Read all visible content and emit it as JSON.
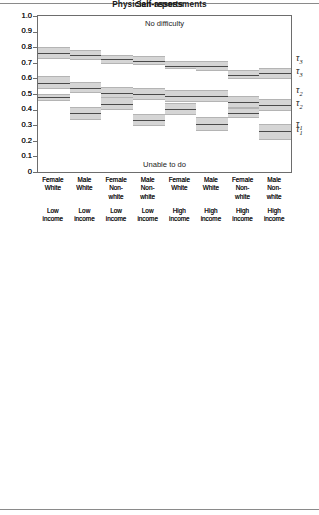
{
  "figure": {
    "categories": [
      {
        "sex": "Female",
        "race": "White",
        "race2": "",
        "income1": "Low",
        "income2": "income"
      },
      {
        "sex": "Male",
        "race": "White",
        "race2": "",
        "income1": "Low",
        "income2": "income"
      },
      {
        "sex": "Female",
        "race": "Non-",
        "race2": "white",
        "income1": "Low",
        "income2": "income"
      },
      {
        "sex": "Male",
        "race": "Non-",
        "race2": "white",
        "income1": "Low",
        "income2": "income"
      },
      {
        "sex": "Female",
        "race": "White",
        "race2": "",
        "income1": "High",
        "income2": "income"
      },
      {
        "sex": "Male",
        "race": "White",
        "race2": "",
        "income1": "High",
        "income2": "income"
      },
      {
        "sex": "Female",
        "race": "Non-",
        "race2": "white",
        "income1": "High",
        "income2": "income"
      },
      {
        "sex": "Male",
        "race": "Non-",
        "race2": "white",
        "income1": "High",
        "income2": "income"
      }
    ],
    "y_ticks": [
      "1.0",
      "0.9",
      "0.8",
      "0.7",
      "0.6",
      "0.5",
      "0.4",
      "0.3",
      "0.2",
      "0.1",
      "0"
    ],
    "threshold_labels": [
      {
        "glyph": "τ",
        "sub": "3"
      },
      {
        "glyph": "τ",
        "sub": "2"
      },
      {
        "glyph": "τ",
        "sub": "1"
      }
    ],
    "top_annotation": "No difficulty",
    "bottom_annotation": "Unable to do"
  },
  "chart_data": [
    {
      "type": "line",
      "title": "Physician-assessments",
      "xlabel": "",
      "ylabel": "",
      "ylim": [
        0,
        1
      ],
      "grid": false,
      "legend": "right-outside",
      "categories": [
        "Female White Low income",
        "Male White Low income",
        "Female Non-white Low income",
        "Male Non-white Low income",
        "Female White High income",
        "Male White High income",
        "Female Non-white High income",
        "Male Non-white High income"
      ],
      "annotations": [
        "No difficulty",
        "Unable to do"
      ],
      "series": [
        {
          "name": "τ3",
          "values": [
            0.925,
            0.885,
            0.875,
            0.835,
            0.805,
            0.775,
            0.755,
            0.715
          ],
          "ci_lower": [
            0.905,
            0.865,
            0.855,
            0.815,
            0.785,
            0.755,
            0.73,
            0.688
          ],
          "ci_upper": [
            0.945,
            0.905,
            0.89,
            0.855,
            0.822,
            0.795,
            0.775,
            0.74
          ]
        },
        {
          "name": "τ2",
          "values": [
            0.715,
            0.69,
            0.665,
            0.625,
            0.605,
            0.57,
            0.548,
            0.515
          ],
          "ci_lower": [
            0.685,
            0.665,
            0.638,
            0.598,
            0.578,
            0.54,
            0.518,
            0.478
          ],
          "ci_upper": [
            0.742,
            0.715,
            0.69,
            0.65,
            0.63,
            0.598,
            0.578,
            0.548
          ]
        },
        {
          "name": "τ1",
          "values": [
            0.442,
            0.458,
            0.368,
            0.382,
            0.348,
            0.378,
            0.278,
            0.292
          ],
          "ci_lower": [
            0.405,
            0.412,
            0.328,
            0.335,
            0.308,
            0.338,
            0.238,
            0.25
          ],
          "ci_upper": [
            0.478,
            0.5,
            0.405,
            0.425,
            0.388,
            0.412,
            0.32,
            0.335
          ]
        }
      ]
    },
    {
      "type": "line",
      "title": "Self-reports",
      "xlabel": "",
      "ylabel": "",
      "ylim": [
        0,
        1
      ],
      "grid": false,
      "legend": "right-outside",
      "categories": [
        "Female White Low income",
        "Male White Low income",
        "Female Non-white Low income",
        "Male Non-white Low income",
        "Female White High income",
        "Male White High income",
        "Female Non-white High income",
        "Male Non-white High income"
      ],
      "annotations": [
        "No difficulty",
        "Unable to do"
      ],
      "series": [
        {
          "name": "τ3",
          "values": [
            0.762,
            0.752,
            0.722,
            0.712,
            0.682,
            0.682,
            0.622,
            0.632
          ],
          "ci_lower": [
            0.722,
            0.718,
            0.692,
            0.685,
            0.658,
            0.65,
            0.598,
            0.598
          ],
          "ci_upper": [
            0.8,
            0.785,
            0.752,
            0.745,
            0.712,
            0.712,
            0.652,
            0.665
          ]
        },
        {
          "name": "τ2",
          "values": [
            0.572,
            0.54,
            0.508,
            0.5,
            0.488,
            0.488,
            0.448,
            0.432
          ],
          "ci_lower": [
            0.532,
            0.505,
            0.472,
            0.462,
            0.45,
            0.45,
            0.408,
            0.388
          ],
          "ci_upper": [
            0.615,
            0.575,
            0.545,
            0.538,
            0.525,
            0.525,
            0.49,
            0.47
          ]
        },
        {
          "name": "τ1",
          "values": [
            0.478,
            0.378,
            0.435,
            0.332,
            0.402,
            0.305,
            0.38,
            0.262
          ],
          "ci_lower": [
            0.455,
            0.335,
            0.398,
            0.295,
            0.365,
            0.26,
            0.348,
            0.205
          ],
          "ci_upper": [
            0.498,
            0.418,
            0.478,
            0.372,
            0.442,
            0.352,
            0.412,
            0.308
          ]
        }
      ]
    }
  ]
}
